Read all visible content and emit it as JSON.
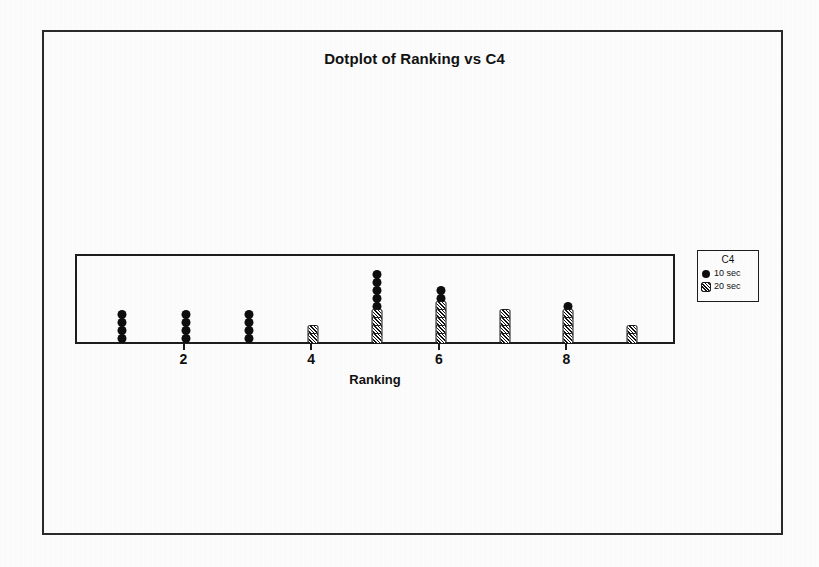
{
  "figure": {
    "title": "Dotplot of Ranking vs C4"
  },
  "axis": {
    "x_title": "Ranking",
    "x_ticks": [
      "2",
      "4",
      "6",
      "8"
    ]
  },
  "legend": {
    "title": "C4",
    "entries": [
      {
        "marker": "circle",
        "label": "10 sec"
      },
      {
        "marker": "square",
        "label": "20 sec"
      }
    ]
  },
  "chart_data": {
    "type": "scatter",
    "subtype": "dotplot",
    "title": "Dotplot of Ranking vs C4",
    "xlabel": "Ranking",
    "ylabel": "",
    "xlim": [
      0.3,
      9.7
    ],
    "xticks": [
      2,
      4,
      6,
      8
    ],
    "grid": false,
    "legend_title": "C4",
    "legend_position": "right-outside",
    "marker_map": {
      "10 sec": "circle-filled",
      "20 sec": "square-hatched"
    },
    "categories": [
      1,
      2,
      3,
      4,
      5,
      6,
      7,
      8,
      9
    ],
    "series": [
      {
        "name": "10 sec",
        "marker": "circle",
        "values": [
          4,
          4,
          4,
          0,
          5,
          2,
          0,
          1,
          0
        ]
      },
      {
        "name": "20 sec",
        "marker": "square",
        "values": [
          0,
          0,
          0,
          2,
          4,
          5,
          4,
          4,
          2
        ]
      }
    ],
    "stacks": [
      {
        "x": 1,
        "circles": 4,
        "squares": 0
      },
      {
        "x": 2,
        "circles": 4,
        "squares": 0
      },
      {
        "x": 3,
        "circles": 4,
        "squares": 0
      },
      {
        "x": 4,
        "circles": 0,
        "squares": 2
      },
      {
        "x": 5,
        "circles": 5,
        "squares": 4
      },
      {
        "x": 6,
        "circles": 2,
        "squares": 5
      },
      {
        "x": 7,
        "circles": 0,
        "squares": 4
      },
      {
        "x": 8,
        "circles": 1,
        "squares": 4
      },
      {
        "x": 9,
        "circles": 0,
        "squares": 2
      }
    ]
  },
  "colors": {
    "marker": "#0d0d0d",
    "frame": "#1d1d1d",
    "background": "#ffffff"
  }
}
